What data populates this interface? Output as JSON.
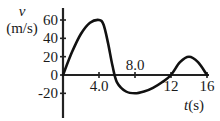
{
  "chart_data": {
    "type": "line",
    "title": "",
    "xlabel": "t(s)",
    "ylabel": "v (m/s)",
    "ylabel_symbol": "v",
    "ylabel_unit": "(m/s)",
    "xlabel_symbol": "t",
    "xlabel_unit": "(s)",
    "xlim": [
      0,
      16
    ],
    "ylim": [
      -20,
      60
    ],
    "x_ticks": [
      4.0,
      8.0,
      12,
      16
    ],
    "x_tick_labels": [
      "4.0",
      "8.0",
      "12",
      "16"
    ],
    "y_ticks": [
      60,
      40,
      20,
      0,
      -20
    ],
    "y_tick_labels": [
      "60",
      "40",
      "20",
      "0",
      "-20"
    ],
    "grid": false,
    "legend": null,
    "series": [
      {
        "name": "v(t)",
        "x": [
          0,
          1,
          2,
          3,
          4,
          4.5,
          5,
          5.5,
          6,
          7,
          8,
          9,
          10,
          11,
          12,
          13,
          14,
          15,
          16
        ],
        "values": [
          0,
          25,
          45,
          57,
          60,
          55,
          35,
          10,
          -8,
          -18,
          -20,
          -18,
          -14,
          -8,
          0,
          14,
          20,
          14,
          0
        ]
      }
    ]
  }
}
